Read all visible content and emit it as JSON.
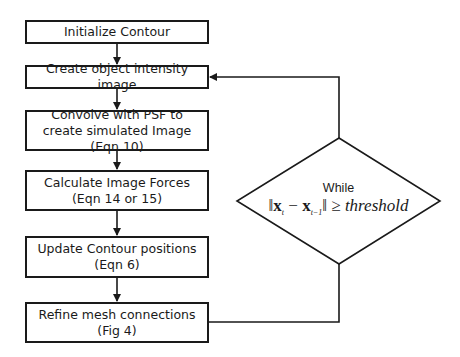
{
  "diagram": {
    "type": "flowchart",
    "steps": [
      {
        "id": "init",
        "label": "Initialize Contour"
      },
      {
        "id": "intensity",
        "label": "Create object intensity image"
      },
      {
        "id": "convolve",
        "label": "Convolve with PSF to create simulated Image (Eqn 10)"
      },
      {
        "id": "forces",
        "label": "Calculate Image Forces (Eqn 14 or 15)"
      },
      {
        "id": "update",
        "label": "Update Contour positions (Eqn 6)"
      },
      {
        "id": "refine",
        "label": "Refine mesh connections (Fig 4)"
      }
    ],
    "decision": {
      "label_top": "While",
      "expr_norm_open": "‖",
      "expr_x1": "x",
      "expr_sub1": "t",
      "expr_minus": " − ",
      "expr_x2": "x",
      "expr_sub2": "t−1",
      "expr_norm_close": "‖",
      "expr_ge": " ≥ ",
      "expr_threshold": "threshold"
    },
    "edges": [
      {
        "from": "init",
        "to": "intensity"
      },
      {
        "from": "intensity",
        "to": "convolve"
      },
      {
        "from": "convolve",
        "to": "forces"
      },
      {
        "from": "forces",
        "to": "update"
      },
      {
        "from": "update",
        "to": "refine"
      },
      {
        "from": "refine",
        "to": "decision"
      },
      {
        "from": "decision",
        "to": "intensity",
        "label": "loop"
      }
    ],
    "colors": {
      "stroke": "#1a1a1a",
      "background": "#ffffff"
    }
  }
}
